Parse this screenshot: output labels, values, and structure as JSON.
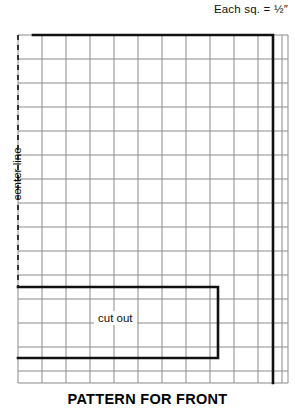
{
  "header": {
    "scale_note": "Each sq.  =  ½″"
  },
  "labels": {
    "center_line": "center line",
    "cut_out": "cut out"
  },
  "caption": {
    "title": "PATTERN FOR FRONT"
  },
  "colors": {
    "grid_line": "#8a8a8a",
    "outline": "#111111",
    "background": "#ffffff",
    "text": "#111111"
  },
  "diagram": {
    "grid": {
      "left": 18,
      "top": 35,
      "right": 288,
      "bottom": 383,
      "cell_size": 24,
      "columns": 11,
      "rows": 14
    },
    "pattern_outline": {
      "top_left_x": 33,
      "top_y": 35,
      "right_x": 273,
      "bottom_y": 383
    },
    "cut_out_rect": {
      "left": 18,
      "top": 287,
      "right": 218,
      "bottom": 358
    },
    "center_line": {
      "x": 18,
      "top": 35,
      "bottom": 287,
      "style": "dashed"
    }
  }
}
